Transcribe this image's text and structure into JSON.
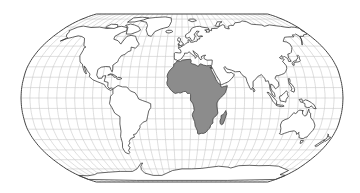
{
  "map": {
    "projection": "robinson",
    "title": "",
    "highlighted_region": "Africa",
    "colors": {
      "background": "#ffffff",
      "ocean": "#ffffff",
      "land": "#ffffff",
      "highlight": "#8c8c8c",
      "coastline": "#222222",
      "graticule": "#c8c8c8",
      "frame": "#444444"
    },
    "graticule": {
      "lon_step_deg": 10,
      "lat_step_deg": 10
    },
    "frame_px": {
      "left": 21,
      "right": 343,
      "top": 14,
      "bottom": 182
    },
    "regions": [
      {
        "name": "North America",
        "highlighted": false
      },
      {
        "name": "Greenland",
        "highlighted": false
      },
      {
        "name": "South America",
        "highlighted": false
      },
      {
        "name": "Europe",
        "highlighted": false
      },
      {
        "name": "Asia",
        "highlighted": false
      },
      {
        "name": "Africa",
        "highlighted": true
      },
      {
        "name": "Madagascar",
        "highlighted": true
      },
      {
        "name": "Australia",
        "highlighted": false
      },
      {
        "name": "New Zealand",
        "highlighted": false
      },
      {
        "name": "Antarctica",
        "highlighted": false
      }
    ]
  }
}
